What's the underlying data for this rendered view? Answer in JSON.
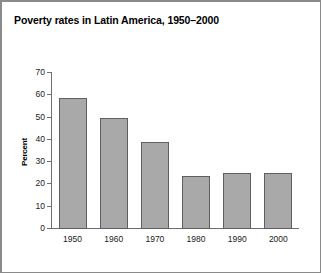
{
  "figure": {
    "title": "Poverty rates in Latin America, 1950–2000",
    "border_color": "#8a8a8a",
    "background": "#ffffff"
  },
  "chart_data": {
    "type": "bar",
    "title": "Poverty rates in Latin America, 1950–2000",
    "xlabel": "",
    "ylabel": "Percent",
    "categories": [
      "1950",
      "1960",
      "1970",
      "1980",
      "1990",
      "2000"
    ],
    "values": [
      59,
      50,
      39,
      24,
      25,
      25
    ],
    "ylim": [
      0,
      70
    ],
    "ytick_labels": [
      "70",
      "60",
      "50",
      "40",
      "30",
      "20",
      "10",
      "0"
    ],
    "ytick_values": [
      70,
      60,
      50,
      40,
      30,
      20,
      10,
      0
    ],
    "ytick_step": 10,
    "grid": false,
    "legend": false,
    "bar_fill_color": "#a9a9a9",
    "bar_edge_color": "#5f5f5f",
    "axis_color": "#6e6e6e"
  }
}
